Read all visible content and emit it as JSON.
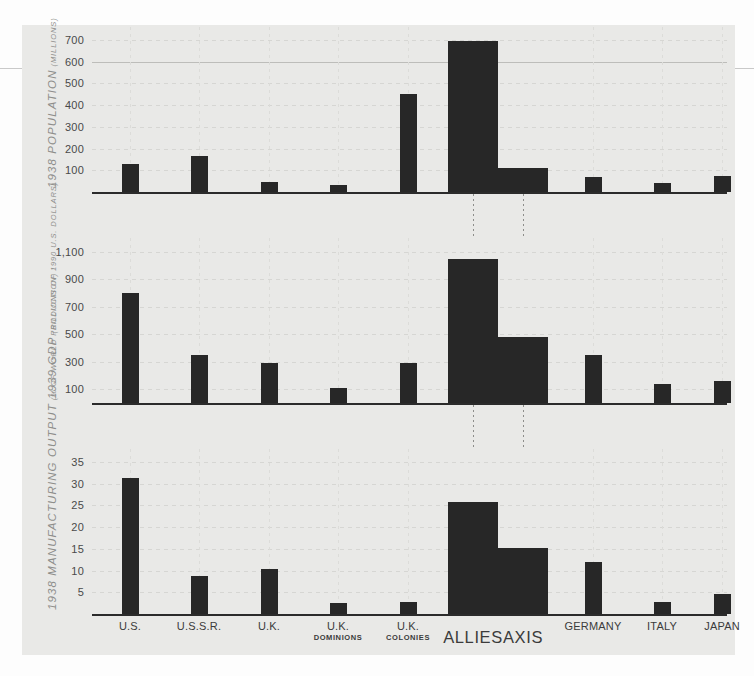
{
  "chart_data": {
    "type": "bar",
    "title": "",
    "categories": [
      "U.S.",
      "U.S.S.R.",
      "U.K.",
      "U.K. DOMINIONS",
      "U.K. COLONIES",
      "ALLIES",
      "AXIS",
      "GERMANY",
      "ITALY",
      "JAPAN"
    ],
    "category_labels": [
      {
        "line1": "U.S.",
        "line2": ""
      },
      {
        "line1": "U.S.S.R.",
        "line2": ""
      },
      {
        "line1": "U.K.",
        "line2": ""
      },
      {
        "line1": "U.K.",
        "line2": "DOMINIONS"
      },
      {
        "line1": "U.K.",
        "line2": "COLONIES"
      },
      {
        "line1": "ALLIES",
        "line2": ""
      },
      {
        "line1": "AXIS",
        "line2": ""
      },
      {
        "line1": "GERMANY",
        "line2": ""
      },
      {
        "line1": "ITALY",
        "line2": ""
      },
      {
        "line1": "JAPAN",
        "line2": ""
      }
    ],
    "grid": true,
    "legend": "none",
    "panels": [
      {
        "id": "population",
        "title": "1938 POPULATION",
        "subtitle": "(MILLIONS)",
        "ylabel": "1938 POPULATION (MILLIONS)",
        "ylim": [
          0,
          760
        ],
        "yticks": [
          100,
          200,
          300,
          400,
          500,
          600,
          700
        ],
        "ytick_labels": [
          "100",
          "200",
          "300",
          "400",
          "500",
          "600",
          "700"
        ],
        "highlight_tick": 600,
        "values": [
          130,
          167,
          47,
          30,
          450,
          695,
          110,
          70,
          43,
          72
        ]
      },
      {
        "id": "gdp",
        "title": "1939 GDP",
        "subtitle": "(BILLIONS OF 1990 U.S. DOLLARS)",
        "ylabel": "1939 GDP (BILLIONS OF 1990 U.S. DOLLARS)",
        "ylim": [
          0,
          1200
        ],
        "yticks": [
          100,
          300,
          500,
          700,
          900,
          1100
        ],
        "ytick_labels": [
          "100",
          "300",
          "500",
          "700",
          "900",
          "1,100"
        ],
        "values": [
          800,
          350,
          290,
          110,
          290,
          1050,
          480,
          350,
          140,
          160
        ]
      },
      {
        "id": "manufacturing",
        "title": "1938 MANUFACTURING OUTPUT",
        "subtitle": "(% OF WORLD PRODUCTION)",
        "ylabel": "1938 MANUFACTURING OUTPUT (% OF WORLD PRODUCTION)",
        "ylim": [
          0,
          38
        ],
        "yticks": [
          5,
          10,
          15,
          20,
          25,
          30,
          35
        ],
        "ytick_labels": [
          "5",
          "10",
          "15",
          "20",
          "25",
          "30",
          "35"
        ],
        "values": [
          31.4,
          8.7,
          10.4,
          2.5,
          2.7,
          25.7,
          15.3,
          12.0,
          2.8,
          4.5
        ]
      }
    ],
    "colors": {
      "bar": "#272727",
      "panel_background": "#e9e9e7",
      "page_background": "#fdfdfd",
      "axis": "#2b2b2b",
      "gridline": "#d6d6d3",
      "label_text": "#3b3b3b",
      "title_text": "#8e8e8b"
    }
  }
}
